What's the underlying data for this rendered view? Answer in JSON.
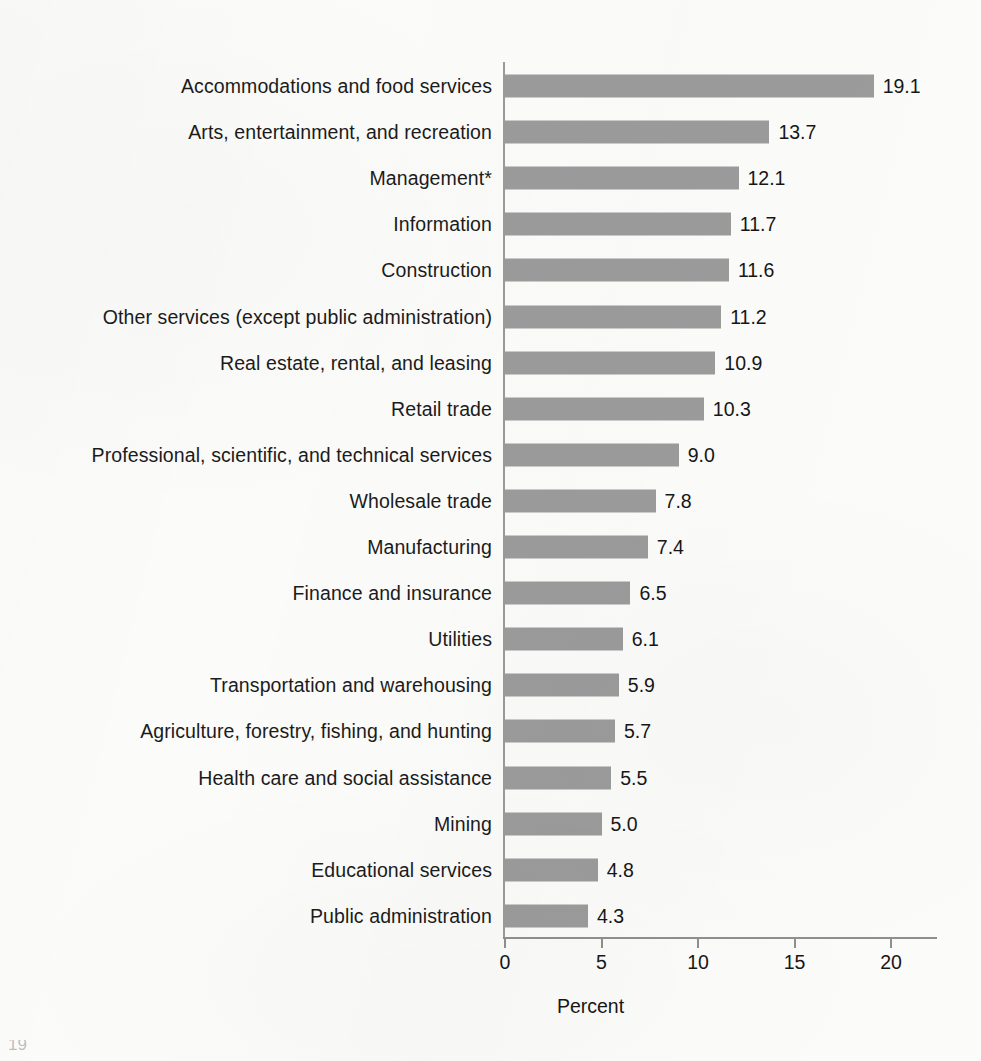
{
  "chart_data": {
    "type": "bar",
    "orientation": "horizontal",
    "title": "",
    "subtitle": "",
    "xlabel": "Percent",
    "ylabel": "",
    "xlim": [
      0,
      20
    ],
    "xticks": [
      0,
      5,
      10,
      15,
      20
    ],
    "xtick_labels": [
      "0",
      "5",
      "10",
      "15",
      "20"
    ],
    "grid": false,
    "legend": false,
    "bar_color": "#9b9b9b",
    "background_color": "#fbfbfa",
    "axis_color": "#8f8f8f",
    "categories": [
      "Accommodations and food services",
      "Arts, entertainment, and recreation",
      "Management*",
      "Information",
      "Construction",
      "Other services (except public administration)",
      "Real estate, rental, and leasing",
      "Retail trade",
      "Professional, scientific, and technical services",
      "Wholesale trade",
      "Manufacturing",
      "Finance and insurance",
      "Utilities",
      "Transportation and warehousing",
      "Agriculture, forestry, fishing, and hunting",
      "Health care and social assistance",
      "Mining",
      "Educational services",
      "Public administration"
    ],
    "values": [
      19.1,
      13.7,
      12.1,
      11.7,
      11.6,
      11.2,
      10.9,
      10.3,
      9.0,
      7.8,
      7.4,
      6.5,
      6.1,
      5.9,
      5.7,
      5.5,
      5.0,
      4.8,
      4.3
    ],
    "value_labels": [
      "19.1",
      "13.7",
      "12.1",
      "11.7",
      "11.6",
      "11.2",
      "10.9",
      "10.3",
      "9.0",
      "7.8",
      "7.4",
      "6.5",
      "6.1",
      "5.9",
      "5.7",
      "5.5",
      "5.0",
      "4.8",
      "4.3"
    ]
  },
  "footnote_fragment": "19"
}
